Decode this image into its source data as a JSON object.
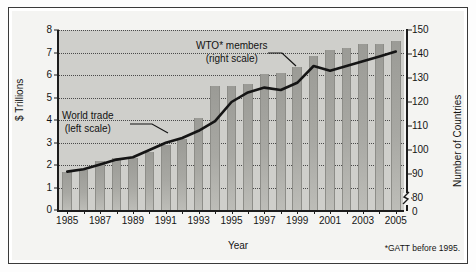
{
  "figure": {
    "footnote": "*GATT before 1995.",
    "annotations": {
      "wto_line1": "WTO* members",
      "wto_line2": "(right scale)",
      "trade_line1": "World trade",
      "trade_line2": "(left scale)"
    }
  },
  "colors": {
    "plot_background": "#cfcfcb",
    "bar_fill": "#a8a8a3",
    "line_stroke": "#151515",
    "axis": "#1c1c1c",
    "gridline": "#4a4a4a",
    "page": "#f4f4f2"
  },
  "chart_data": {
    "type": "bar",
    "title": "",
    "subtitle": "",
    "xlabel": "Year",
    "ylabel": "$ Trillions",
    "y2label": "Number of Countries",
    "grid": true,
    "legend_position": "inline-annotations",
    "categories": [
      "1985",
      "1986",
      "1987",
      "1988",
      "1989",
      "1990",
      "1991",
      "1992",
      "1993",
      "1994",
      "1995",
      "1996",
      "1997",
      "1998",
      "1999",
      "2000",
      "2001",
      "2002",
      "2003",
      "2004",
      "2005"
    ],
    "xtick_labels": [
      "1985",
      "1987",
      "1989",
      "1991",
      "1993",
      "1995",
      "1997",
      "1999",
      "2001",
      "2003",
      "2005"
    ],
    "ylim": [
      0,
      8
    ],
    "yticks": [
      0,
      1,
      2,
      3,
      4,
      5,
      6,
      7,
      8
    ],
    "y2lim": [
      75,
      150
    ],
    "y2ticks": [
      80,
      90,
      100,
      110,
      120,
      130,
      140,
      150
    ],
    "y2_extra_tick": "0",
    "y2_axis_break": true,
    "series": [
      {
        "name": "World trade (left scale)",
        "axis": "left",
        "render": "bar",
        "unit": "$ Trillions",
        "values": [
          1.7,
          1.8,
          2.2,
          2.3,
          2.3,
          2.6,
          2.9,
          3.15,
          4.1,
          5.5,
          5.5,
          5.6,
          6.05,
          6.1,
          6.35,
          6.85,
          7.1,
          7.2,
          7.4,
          7.4,
          7.5
        ]
      },
      {
        "name": "WTO* members (right scale)",
        "axis": "right",
        "render": "line",
        "unit": "Number of Countries",
        "values": [
          91,
          92,
          94,
          96,
          97,
          100,
          103,
          105,
          108,
          112,
          120,
          124,
          126,
          125,
          128,
          135,
          133,
          135,
          137,
          139,
          141
        ]
      }
    ]
  }
}
